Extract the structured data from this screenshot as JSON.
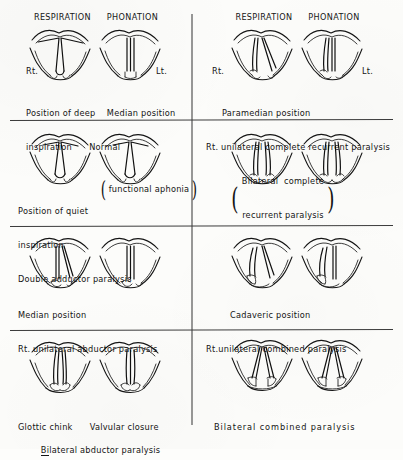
{
  "figure": {
    "ink_color": "#141414",
    "paper_color": "#fcfcfa"
  },
  "column_headings": {
    "respiration": "RESPIRATION",
    "phonation": "PHONATION"
  },
  "side_markers": {
    "right": "Rt.",
    "left": "Lt."
  },
  "panels": [
    {
      "id": "panel-normal",
      "row": 1,
      "column": "left",
      "has_column_headings": true,
      "has_side_markers": true,
      "caption_style": "split",
      "caption_left": [
        "Position of deep",
        "inspiration"
      ],
      "caption_right": [
        "Median position",
        "Normal"
      ],
      "caption_lines": [
        "Position of deep    Median position",
        "inspiration      Normal"
      ],
      "diagrams": [
        {
          "name": "respiration-deep-inspiration",
          "cord_position": "wide-abduction-triangle"
        },
        {
          "name": "phonation-median",
          "cord_position": "median-closed"
        }
      ]
    },
    {
      "id": "panel-paramedian",
      "row": 1,
      "column": "right",
      "has_column_headings": true,
      "has_side_markers": true,
      "caption_style": "lines",
      "caption_lines": [
        "Paramedian position",
        "Rt. unilateral complete recurrent paralysis"
      ],
      "diagrams": [
        {
          "name": "respiration-paramedian-right-paralysis",
          "cord_position": "right-paramedian"
        },
        {
          "name": "phonation-paramedian-right-paralysis",
          "cord_position": "right-paramedian-phonation"
        }
      ]
    },
    {
      "id": "panel-double-adductor",
      "row": 2,
      "column": "left",
      "has_column_headings": false,
      "has_side_markers": false,
      "caption_style": "split-paren",
      "caption_lines": [
        "Position of quiet",
        "inspiration",
        "Double adductor paralysis"
      ],
      "paren_text": [
        "functional aphonia"
      ],
      "diagrams": [
        {
          "name": "respiration-quiet-inspiration",
          "cord_position": "quiet-inspiration-triangle"
        },
        {
          "name": "phonation-double-adductor-paralysis",
          "cord_position": "quiet-inspiration-triangle"
        }
      ]
    },
    {
      "id": "panel-bilateral-recurrent",
      "row": 2,
      "column": "right",
      "has_column_headings": false,
      "has_side_markers": false,
      "caption_style": "paren-only",
      "paren_text": [
        "Bilateral  complete",
        "recurrent paralysis"
      ],
      "caption_lines": [
        "Bilateral  complete",
        "recurrent paralysis"
      ],
      "diagrams": [
        {
          "name": "respiration-bilateral-recurrent-paralysis",
          "cord_position": "bilateral-paramedian"
        },
        {
          "name": "phonation-bilateral-recurrent-paralysis",
          "cord_position": "bilateral-paramedian"
        }
      ]
    },
    {
      "id": "panel-median-abductor",
      "row": 3,
      "column": "left",
      "has_column_headings": false,
      "has_side_markers": false,
      "caption_style": "lines",
      "caption_lines": [
        "Median position",
        "Rt. unilateral abductor paralysis"
      ],
      "diagrams": [
        {
          "name": "respiration-right-abductor-paralysis",
          "cord_position": "right-median-left-abducted"
        },
        {
          "name": "phonation-right-abductor-paralysis",
          "cord_position": "median-closed"
        }
      ]
    },
    {
      "id": "panel-cadaveric",
      "row": 3,
      "column": "right",
      "has_column_headings": false,
      "has_side_markers": false,
      "caption_style": "lines",
      "caption_lines": [
        "Cadaveric position",
        "Rt.unilateral combined paralysis"
      ],
      "diagrams": [
        {
          "name": "respiration-cadaveric-right-combined",
          "cord_position": "right-cadaveric"
        },
        {
          "name": "phonation-cadaveric-right-combined",
          "cord_position": "right-cadaveric-phonation"
        }
      ]
    },
    {
      "id": "panel-bilateral-abductor",
      "row": 4,
      "column": "left",
      "has_column_headings": false,
      "has_side_markers": false,
      "caption_style": "split-underline",
      "caption_left": [
        "Glottic chink"
      ],
      "caption_right": [
        "Valvular closure"
      ],
      "caption_lines": [
        "Glottic chink      Valvular closure",
        "Bilateral abductor paralysis"
      ],
      "underlined_prefix": "Bi",
      "caption_bottom": "Bilateral abductor paralysis",
      "diagrams": [
        {
          "name": "respiration-glottic-chink",
          "cord_position": "narrow-chink"
        },
        {
          "name": "phonation-valvular-closure",
          "cord_position": "valvular-closed"
        }
      ]
    },
    {
      "id": "panel-bilateral-combined",
      "row": 4,
      "column": "right",
      "has_column_headings": false,
      "has_side_markers": false,
      "caption_style": "lines",
      "caption_lines": [
        "Bilateral combined paralysis"
      ],
      "diagrams": [
        {
          "name": "respiration-bilateral-combined-paralysis",
          "cord_position": "bilateral-cadaveric"
        },
        {
          "name": "phonation-bilateral-combined-paralysis",
          "cord_position": "bilateral-cadaveric"
        }
      ]
    }
  ],
  "dividers": {
    "vertical_x": 192,
    "horizontal_y": [
      120,
      226,
      330
    ]
  }
}
